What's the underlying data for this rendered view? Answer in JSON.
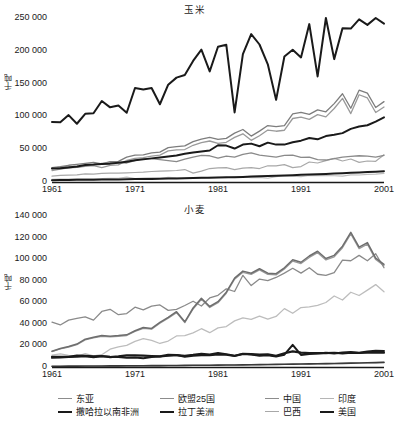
{
  "figure": {
    "panels": [
      {
        "title": "玉米",
        "ylabel": "千吨"
      },
      {
        "title": "小麦",
        "ylabel": "千吨"
      }
    ]
  },
  "legend": {
    "entries": [
      {
        "label": "东亚",
        "color": "#8c8c8c",
        "width": 1.2
      },
      {
        "label": "欧盟25国",
        "color": "#8c8c8c",
        "width": 1.2
      },
      {
        "label": "中国",
        "color": "#8c8c8c",
        "width": 1.2
      },
      {
        "label": "印度",
        "color": "#b5b5b5",
        "width": 1.2
      },
      {
        "label": "撒哈拉以南非洲",
        "color": "#1a1a1a",
        "width": 2.0
      },
      {
        "label": "拉丁美洲",
        "color": "#1a1a1a",
        "width": 2.0
      },
      {
        "label": "巴西",
        "color": "#a8a8a8",
        "width": 1.2
      },
      {
        "label": "美国",
        "color": "#1a1a1a",
        "width": 2.0
      }
    ]
  },
  "chart_data": [
    {
      "type": "line",
      "title": "玉米",
      "xlabel": "",
      "ylabel": "千吨",
      "xlim": [
        1961,
        2001
      ],
      "ylim": [
        0,
        250000
      ],
      "xticks": [
        1961,
        1971,
        1981,
        1991,
        2001
      ],
      "yticks": [
        0,
        50000,
        100000,
        150000,
        200000,
        250000
      ],
      "ytick_labels": [
        "0",
        "50 000",
        "100 000",
        "150 000",
        "200 000",
        "250 000"
      ],
      "grid": false,
      "legend_position": "below-figure",
      "x": [
        1961,
        1962,
        1963,
        1964,
        1965,
        1966,
        1967,
        1968,
        1969,
        1970,
        1971,
        1972,
        1973,
        1974,
        1975,
        1976,
        1977,
        1978,
        1979,
        1980,
        1981,
        1982,
        1983,
        1984,
        1985,
        1986,
        1987,
        1988,
        1989,
        1990,
        1991,
        1992,
        1993,
        1994,
        1995,
        1996,
        1997,
        1998,
        1999,
        2000,
        2001
      ],
      "series": [
        {
          "name": "美国",
          "color": "#1a1a1a",
          "width": 2.0,
          "values": [
            91400,
            90900,
            102000,
            88800,
            104000,
            104900,
            123500,
            113800,
            116500,
            105500,
            143300,
            141100,
            143300,
            118500,
            148400,
            159100,
            163200,
            184600,
            201700,
            168600,
            206200,
            209200,
            106000,
            194900,
            225500,
            209600,
            179400,
            125200,
            191300,
            201500,
            189900,
            240700,
            160900,
            255300,
            187300,
            234500,
            233900,
            247900,
            239500,
            251900,
            241500
          ],
          "note": "plotted scaled to chart span; peak near 195000 in 2001 as drawn"
        },
        {
          "name": "中国",
          "color": "#9a9a9a",
          "width": 1.3,
          "values": [
            17500,
            19500,
            21500,
            22500,
            24000,
            25000,
            22000,
            25500,
            26000,
            33000,
            36000,
            37000,
            39500,
            41000,
            47500,
            49000,
            49500,
            56000,
            60000,
            62500,
            59000,
            60500,
            68000,
            73500,
            63500,
            70500,
            79200,
            77400,
            78900,
            96800,
            98800,
            95400,
            102700,
            99300,
            112000,
            127500,
            104300,
            133000,
            128100,
            106000,
            114300
          ]
        },
        {
          "name": "东亚",
          "color": "#7d7d7d",
          "width": 1.3,
          "values": [
            22000,
            23500,
            25500,
            27000,
            28500,
            30000,
            27500,
            31000,
            31500,
            38000,
            41000,
            41500,
            44500,
            45500,
            52500,
            54000,
            55000,
            61500,
            65500,
            68000,
            65000,
            66500,
            74500,
            80000,
            70000,
            77500,
            86000,
            84500,
            86000,
            104000,
            106000,
            103000,
            110000,
            107000,
            119500,
            134500,
            112500,
            140000,
            135500,
            113500,
            122500
          ]
        },
        {
          "name": "欧盟25国",
          "color": "#8a8a8a",
          "width": 1.3,
          "values": [
            20500,
            22500,
            23500,
            22500,
            25000,
            26500,
            28500,
            29500,
            30000,
            29000,
            32500,
            35500,
            35500,
            34000,
            32500,
            31000,
            35000,
            38000,
            40500,
            40000,
            36500,
            39500,
            38000,
            42000,
            44500,
            41000,
            39500,
            38000,
            40500,
            41000,
            37500,
            38000,
            34000,
            33500,
            35500,
            38000,
            39000,
            40000,
            39500,
            38000,
            40500
          ]
        },
        {
          "name": "拉丁美洲",
          "color": "#1a1a1a",
          "width": 2.0,
          "values": [
            20500,
            21000,
            22000,
            23500,
            26000,
            26500,
            27500,
            28000,
            29500,
            31000,
            33000,
            34500,
            36000,
            37500,
            39000,
            40500,
            43000,
            45000,
            46500,
            48000,
            56000,
            55500,
            51000,
            57000,
            58500,
            54500,
            60000,
            57000,
            57000,
            60500,
            63000,
            67000,
            65000,
            70000,
            72000,
            74500,
            81000,
            84500,
            86500,
            92000,
            98500
          ]
        },
        {
          "name": "巴西",
          "color": "#a8a8a8",
          "width": 1.2,
          "values": [
            9000,
            10000,
            10500,
            11000,
            12500,
            12000,
            13000,
            13500,
            13500,
            14000,
            14500,
            15000,
            16000,
            16500,
            17000,
            17500,
            19000,
            13500,
            16500,
            20500,
            21500,
            21800,
            19000,
            21200,
            22000,
            20500,
            24700,
            24700,
            26500,
            22000,
            23500,
            30500,
            29000,
            32500,
            36000,
            32000,
            35000,
            30000,
            32000,
            31500,
            41500
          ]
        },
        {
          "name": "印度",
          "color": "#bdbdbd",
          "width": 1.2,
          "values": [
            4200,
            4500,
            4600,
            4700,
            4800,
            4900,
            5000,
            5500,
            5700,
            7500,
            5100,
            6000,
            6200,
            5600,
            7200,
            6400,
            6000,
            6300,
            5700,
            7000,
            6900,
            6500,
            8000,
            7700,
            6600,
            7000,
            5700,
            8200,
            9600,
            9000,
            8100,
            9900,
            9700,
            9600,
            9500,
            8900,
            10800,
            10700,
            11500,
            12000,
            13100
          ]
        },
        {
          "name": "撒哈拉以南非洲",
          "color": "#1a1a1a",
          "width": 2.0,
          "values": [
            2800,
            3000,
            3100,
            3300,
            3400,
            3500,
            3700,
            3800,
            4000,
            4200,
            4400,
            4500,
            4700,
            5000,
            5200,
            5500,
            5700,
            6000,
            6300,
            6600,
            7000,
            7200,
            7400,
            7800,
            8300,
            8700,
            9100,
            9500,
            10000,
            10400,
            10900,
            11300,
            11800,
            12300,
            12900,
            13400,
            14000,
            14600,
            15200,
            15800,
            16500
          ]
        }
      ]
    },
    {
      "type": "line",
      "title": "小麦",
      "xlabel": "",
      "ylabel": "千吨",
      "xlim": [
        1961,
        2001
      ],
      "ylim": [
        0,
        140000
      ],
      "xticks": [
        1961,
        1971,
        1981,
        1991,
        2001
      ],
      "yticks": [
        0,
        20000,
        40000,
        60000,
        80000,
        100000,
        120000,
        140000
      ],
      "ytick_labels": [
        "0",
        "20 000",
        "40 000",
        "60 000",
        "80 000",
        "100 000",
        "120 000",
        "140 000"
      ],
      "grid": false,
      "legend_position": "below-figure",
      "x": [
        1961,
        1962,
        1963,
        1964,
        1965,
        1966,
        1967,
        1968,
        1969,
        1970,
        1971,
        1972,
        1973,
        1974,
        1975,
        1976,
        1977,
        1978,
        1979,
        1980,
        1981,
        1982,
        1983,
        1984,
        1985,
        1986,
        1987,
        1988,
        1989,
        1990,
        1991,
        1992,
        1993,
        1994,
        1995,
        1996,
        1997,
        1998,
        1999,
        2000,
        2001
      ],
      "series": [
        {
          "name": "中国",
          "color": "#9a9a9a",
          "width": 1.3,
          "values": [
            14250,
            16700,
            18500,
            20800,
            25200,
            27000,
            28500,
            28000,
            28500,
            29200,
            32900,
            35900,
            35100,
            40500,
            45300,
            50400,
            41100,
            53800,
            62700,
            55200,
            59600,
            68400,
            81400,
            87800,
            85800,
            90000,
            85900,
            85400,
            90800,
            98200,
            95900,
            101600,
            106000,
            99300,
            102200,
            110600,
            123300,
            109700,
            113900,
            99600,
            93900
          ]
        },
        {
          "name": "东亚",
          "color": "#6e6e6e",
          "width": 1.5,
          "values": [
            14600,
            17100,
            19000,
            21300,
            25800,
            27600,
            29100,
            28600,
            29100,
            29800,
            33600,
            36600,
            35800,
            41300,
            46100,
            51300,
            41900,
            54700,
            63700,
            56100,
            60600,
            69400,
            82400,
            88900,
            86900,
            91100,
            87000,
            86500,
            92000,
            99400,
            97100,
            102900,
            107300,
            100600,
            103500,
            112000,
            124800,
            111100,
            115300,
            101000,
            95200
          ]
        },
        {
          "name": "欧盟25国",
          "color": "#8a8a8a",
          "width": 1.3,
          "values": [
            41500,
            39000,
            43500,
            45000,
            46500,
            43500,
            51500,
            53500,
            48500,
            49500,
            55500,
            53000,
            56500,
            57500,
            52500,
            53500,
            57000,
            61000,
            56500,
            64000,
            66500,
            72500,
            70000,
            85000,
            75500,
            81500,
            80000,
            83000,
            87000,
            91500,
            87000,
            92000,
            86000,
            85000,
            87500,
            99000,
            98500,
            103500,
            98500,
            105000,
            92000
          ]
        },
        {
          "name": "印度",
          "color": "#bdbdbd",
          "width": 1.3,
          "values": [
            11000,
            12100,
            10800,
            9800,
            12300,
            10400,
            11400,
            16500,
            18700,
            20100,
            23800,
            26400,
            24700,
            21800,
            24100,
            28800,
            29000,
            31700,
            35500,
            31800,
            36300,
            37500,
            42800,
            45500,
            44100,
            47100,
            44300,
            46900,
            54100,
            49800,
            55100,
            55700,
            57200,
            59800,
            65800,
            62100,
            69300,
            66300,
            71300,
            76400,
            69700
          ]
        },
        {
          "name": "美国",
          "color": "#1a1a1a",
          "width": 2.2,
          "values": [
            9500,
            9300,
            9500,
            10600,
            10400,
            9800,
            10200,
            9200,
            9800,
            10700,
            10800,
            10500,
            10200,
            9800,
            11200,
            11100,
            10400,
            11200,
            12200,
            11400,
            12800,
            11800,
            10400,
            12300,
            12000,
            11400,
            11700,
            10300,
            12700,
            14500,
            13400,
            12900,
            12900,
            12900,
            13200,
            12600,
            13200,
            13000,
            13400,
            13200,
            13200
          ]
        },
        {
          "name": "拉丁美洲",
          "color": "#1a1a1a",
          "width": 2.0,
          "values": [
            8500,
            8900,
            9200,
            9600,
            9900,
            9000,
            10000,
            9500,
            9200,
            8500,
            8700,
            8200,
            9200,
            9800,
            10500,
            11200,
            9500,
            10500,
            11000,
            10800,
            11600,
            11400,
            10200,
            12000,
            11500,
            10400,
            11000,
            9700,
            11400,
            20500,
            11200,
            12000,
            12600,
            13200,
            12500,
            13400,
            14000,
            13300,
            14300,
            15000,
            14800
          ]
        },
        {
          "name": "巴西",
          "color": "#a8a8a8",
          "width": 1.2,
          "values": [
            550,
            600,
            580,
            620,
            650,
            700,
            750,
            780,
            820,
            850,
            900,
            950,
            1000,
            1100,
            1200,
            1300,
            1400,
            1450,
            1500,
            1600,
            1700,
            1750,
            1800,
            1900,
            2000,
            2100,
            2200,
            2300,
            2400,
            2500,
            2600,
            2700,
            2800,
            2950,
            3100,
            3300,
            3500,
            3700,
            3900,
            4100,
            4400
          ]
        },
        {
          "name": "撒哈拉以南非洲",
          "color": "#3a3a3a",
          "width": 1.6,
          "values": [
            700,
            740,
            780,
            820,
            860,
            900,
            950,
            1000,
            1050,
            1100,
            1150,
            1200,
            1260,
            1320,
            1380,
            1440,
            1500,
            1560,
            1620,
            1680,
            1760,
            1840,
            1920,
            2000,
            2100,
            2200,
            2300,
            2400,
            2500,
            2620,
            2740,
            2860,
            2980,
            3120,
            3260,
            3400,
            3560,
            3720,
            3880,
            4050,
            4250
          ]
        }
      ]
    }
  ]
}
